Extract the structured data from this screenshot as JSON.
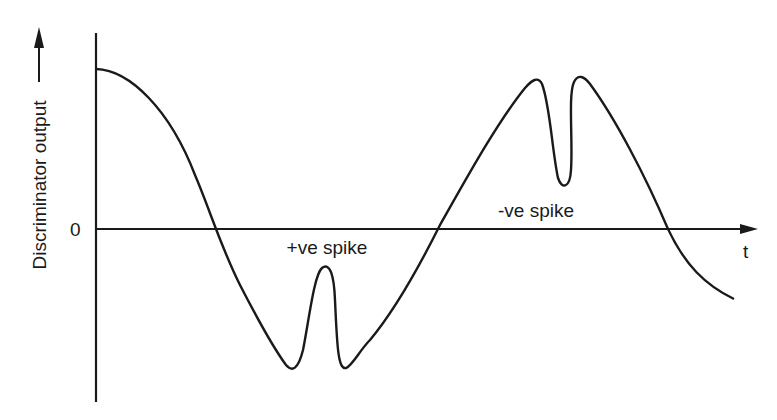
{
  "diagram": {
    "type": "waveform",
    "y_axis_label": "Discriminator output",
    "x_axis_label": "t",
    "origin_label": "0",
    "annotations": {
      "positive_spike": "+ve spike",
      "negative_spike": "-ve spike"
    },
    "ink_color": "#1a1a1a"
  }
}
